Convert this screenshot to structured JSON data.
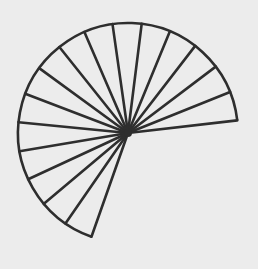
{
  "diagram": {
    "type": "circular-sector-divided-into-equal-slices",
    "background_color": "#ececec",
    "stroke_color": "#2e2e2e",
    "fill_color": "#ececec",
    "stroke_width": 2.6,
    "center": {
      "x": 128,
      "y": 133
    },
    "radius": 110,
    "start_angle_deg": 6.6,
    "sweep_angle_deg": 244,
    "direction": "counter-clockwise",
    "slice_count": 16,
    "radial_line_count": 17
  }
}
